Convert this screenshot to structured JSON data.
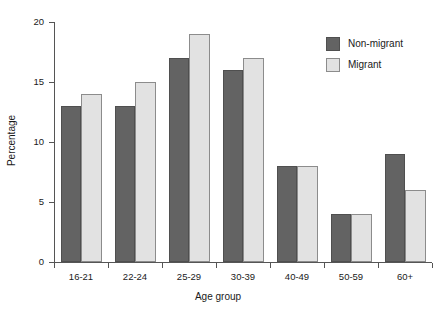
{
  "chart_data": {
    "type": "bar",
    "title": "",
    "subtitle": "",
    "xlabel": "Age group",
    "ylabel": "Percentage",
    "categories": [
      "16-21",
      "22-24",
      "25-29",
      "30-39",
      "40-49",
      "50-59",
      "60+"
    ],
    "series": [
      {
        "name": "Non-migrant",
        "color": "#636363",
        "values": [
          13,
          13,
          17,
          16,
          8,
          4,
          9
        ]
      },
      {
        "name": "Migrant",
        "color": "#e2e2e2",
        "values": [
          14,
          15,
          19,
          17,
          8,
          4,
          6
        ]
      }
    ],
    "ylim": [
      0,
      20
    ],
    "ytick_labels": [
      "0",
      "5",
      "10",
      "15",
      "20"
    ],
    "ytick_values": [
      0,
      5,
      10,
      15,
      20
    ],
    "grid": false,
    "legend_position": "top-right",
    "bar_grouping": "grouped"
  }
}
